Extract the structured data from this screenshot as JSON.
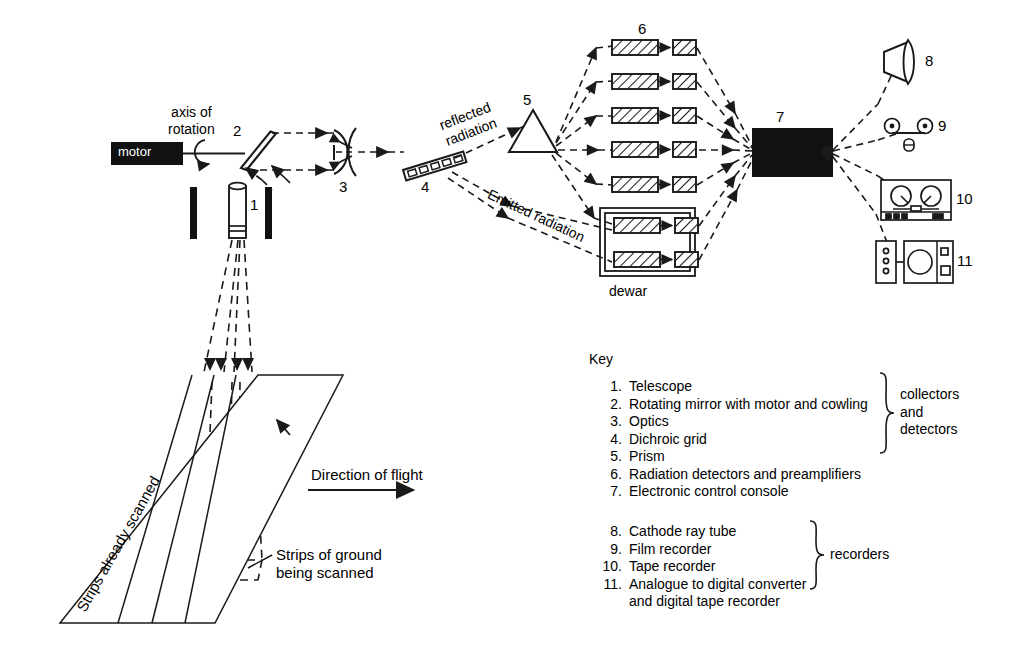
{
  "diagram": {
    "labels": {
      "motor": "motor",
      "axis_of_rotation": "axis of\nrotation",
      "reflected_radiation": "reflected\nradiation",
      "emitted_radiation": "Emitted radiation",
      "dewar": "dewar",
      "direction_of_flight": "Direction of flight",
      "strips_already_scanned": "Strips already scanned",
      "strips_being_scanned": "Strips of ground\nbeing scanned"
    },
    "callout_numbers": {
      "telescope": "1",
      "rotating_mirror": "2",
      "optics": "3",
      "dichroic_grid": "4",
      "prism": "5",
      "detectors": "6",
      "console": "7",
      "crt": "8",
      "film_recorder": "9",
      "tape_recorder": "10",
      "adc": "11"
    },
    "detector_rows": 7,
    "dewar_rows": 2,
    "ground_strips": 4,
    "colors": {
      "ink": "#1a1a1a",
      "fill_black": "#111111",
      "paper": "#ffffff"
    }
  },
  "key": {
    "title": "Key",
    "items": [
      {
        "n": "1.",
        "text": "Telescope"
      },
      {
        "n": "2.",
        "text": "Rotating mirror with motor and cowling"
      },
      {
        "n": "3.",
        "text": "Optics"
      },
      {
        "n": "4.",
        "text": "Dichroic grid"
      },
      {
        "n": "5.",
        "text": "Prism"
      },
      {
        "n": "6.",
        "text": "Radiation detectors and preamplifiers"
      },
      {
        "n": "7.",
        "text": "Electronic control console"
      },
      {
        "n": "8.",
        "text": "Cathode ray tube"
      },
      {
        "n": "9.",
        "text": "Film recorder"
      },
      {
        "n": "10.",
        "text": "Tape recorder"
      },
      {
        "n": "11.",
        "text": "Analogue to digital converter\nand digital tape recorder"
      }
    ],
    "group_collectors": "collectors\nand\ndetectors",
    "group_recorders": "recorders"
  }
}
